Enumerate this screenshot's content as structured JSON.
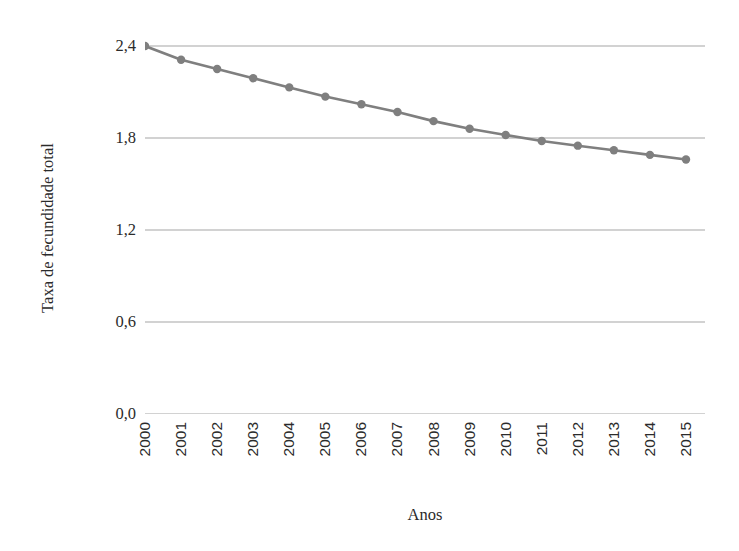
{
  "chart_data": {
    "type": "line",
    "title": "",
    "xlabel": "Anos",
    "ylabel": "Taxa de fecundidade total",
    "categories": [
      "2000",
      "2001",
      "2002",
      "2003",
      "2004",
      "2005",
      "2006",
      "2007",
      "2008",
      "2009",
      "2010",
      "2011",
      "2012",
      "2013",
      "2014",
      "2015"
    ],
    "values": [
      2.4,
      2.31,
      2.25,
      2.19,
      2.13,
      2.07,
      2.02,
      1.97,
      1.91,
      1.86,
      1.82,
      1.78,
      1.75,
      1.72,
      1.69,
      1.66
    ],
    "series": [
      {
        "name": "Taxa de fecundidade total",
        "values": [
          2.4,
          2.31,
          2.25,
          2.19,
          2.13,
          2.07,
          2.02,
          1.97,
          1.91,
          1.86,
          1.82,
          1.78,
          1.75,
          1.72,
          1.69,
          1.66
        ]
      }
    ],
    "ylim": [
      0.0,
      2.4
    ],
    "yticks": [
      0.0,
      0.6,
      1.2,
      1.8,
      2.4
    ],
    "ytick_labels": [
      "0,0",
      "0,6",
      "1,2",
      "1,8",
      "2,4"
    ],
    "xtick_labels": [
      "2000",
      "2001",
      "2002",
      "2003",
      "2004",
      "2005",
      "2006",
      "2007",
      "2008",
      "2009",
      "2010",
      "2011",
      "2012",
      "2013",
      "2014",
      "2015"
    ],
    "grid": "horizontal",
    "legend": "none",
    "line_color": "#7f7f7f",
    "marker_color": "#7f7f7f",
    "marker_shape": "circle",
    "gridline_color": "#a6a6a6",
    "xtick_rotation": 90
  },
  "axes": {
    "y_title": "Taxa de fecundidade total",
    "x_title": "Anos"
  },
  "title_strip": {
    "text": ""
  }
}
